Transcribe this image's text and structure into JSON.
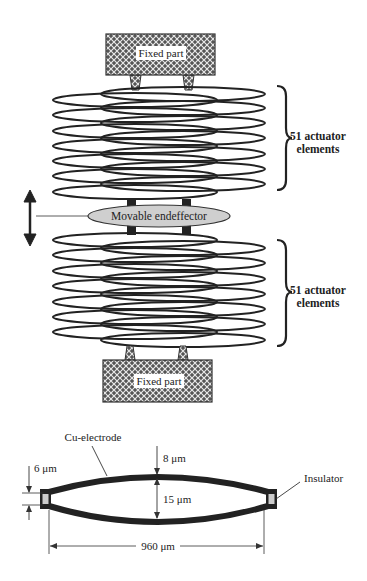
{
  "figure": {
    "top_view": {
      "fixed_part_top_label": "Fixed part",
      "fixed_part_bottom_label": "Fixed part",
      "endeffector_label": "Movable endeffector",
      "upper_stack": {
        "label_line1": "51 actuator",
        "label_line2": "elements"
      },
      "lower_stack": {
        "label_line1": "51 actuator",
        "label_line2": "elements"
      },
      "motion_arrow": "double-vertical-arrow"
    },
    "cross_section": {
      "electrode_label": "Cu-electrode",
      "insulator_label": "Insulator",
      "dim_electrode_thickness": "8 μm",
      "dim_gap": "15 μm",
      "dim_end_gap": "6 μm",
      "dim_width": "960 μm"
    }
  },
  "colors": {
    "line": "#222222",
    "hatch_fill": "#555555",
    "endeffector_fill": "#cfcfcf",
    "insulator_fill": "#cccccc"
  }
}
